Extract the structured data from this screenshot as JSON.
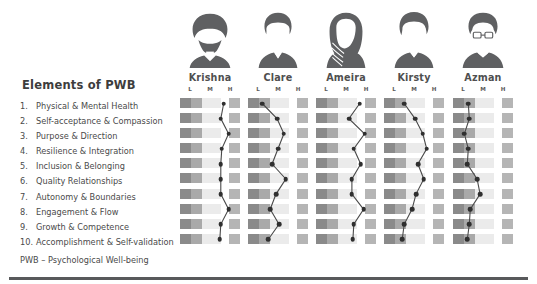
{
  "panel": {
    "title": "Elements of PWB",
    "footnote": "PWB – Psychological Well-being",
    "elements": [
      {
        "num": "1.",
        "label": "Physical & Mental Health"
      },
      {
        "num": "2.",
        "label": "Self-acceptance & Compassion"
      },
      {
        "num": "3.",
        "label": "Purpose & Direction"
      },
      {
        "num": "4.",
        "label": "Resilience & Integration"
      },
      {
        "num": "5.",
        "label": "Inclusion & Belonging"
      },
      {
        "num": "6.",
        "label": "Quality Relationships"
      },
      {
        "num": "7.",
        "label": "Autonomy & Boundaries"
      },
      {
        "num": "8.",
        "label": "Engagement & Flow"
      },
      {
        "num": "9.",
        "label": "Growth & Competence"
      },
      {
        "num": "10.",
        "label": "Accomplishment & Self-validation"
      }
    ]
  },
  "scale": {
    "labels": [
      "L",
      "M",
      "H"
    ],
    "low_label": "L",
    "mid_label": "M",
    "high_label": "H"
  },
  "colors": {
    "ink": "#4a4a4a",
    "avatar": "#5f6062",
    "dot": "#2f2f2f",
    "line": "#4a4a4a",
    "rule": "#58595b",
    "cell_dark": "#8a8a8a",
    "cell_mid": "#a9a9a9",
    "cell_light": "#ebebeb",
    "cell_right": "#b5b5b5"
  },
  "people": [
    {
      "name": "Krishna",
      "avatar": "turban-beard-avatar"
    },
    {
      "name": "Clare",
      "avatar": "short-hair-avatar"
    },
    {
      "name": "Ameira",
      "avatar": "hijab-avatar"
    },
    {
      "name": "Kirsty",
      "avatar": "short-hair-avatar-2"
    },
    {
      "name": "Azman",
      "avatar": "glasses-tie-avatar"
    }
  ],
  "chart_data": {
    "type": "line",
    "title": "Elements of PWB",
    "xlabel": "",
    "ylabel": "Elements of PWB",
    "x": [
      "L",
      "M",
      "H"
    ],
    "xlim": [
      0,
      100
    ],
    "grid": true,
    "legend": "none",
    "note": "Each person has a 10-row profile; value is the horizontal position of the marker along the L–M–H scale (0 = L, 50 = M, 100 = H).",
    "categories": [
      "Physical & Mental Health",
      "Self-acceptance & Compassion",
      "Purpose & Direction",
      "Resilience & Integration",
      "Inclusion & Belonging",
      "Quality Relationships",
      "Autonomy & Boundaries",
      "Engagement & Flow",
      "Growth & Competence",
      "Accomplishment & Self-validation"
    ],
    "series": [
      {
        "name": "Krishna",
        "values": [
          78,
          72,
          88,
          74,
          72,
          72,
          72,
          88,
          72,
          70
        ]
      },
      {
        "name": "Clare",
        "values": [
          18,
          48,
          62,
          50,
          38,
          66,
          46,
          34,
          52,
          30
        ]
      },
      {
        "name": "Ameira",
        "values": [
          78,
          56,
          88,
          66,
          80,
          62,
          62,
          86,
          66,
          64
        ]
      },
      {
        "name": "Kirsty",
        "values": [
          30,
          52,
          68,
          76,
          58,
          70,
          54,
          46,
          30,
          26
        ]
      },
      {
        "name": "Azman",
        "values": [
          20,
          22,
          12,
          20,
          18,
          38,
          44,
          24,
          22,
          18
        ]
      }
    ]
  }
}
